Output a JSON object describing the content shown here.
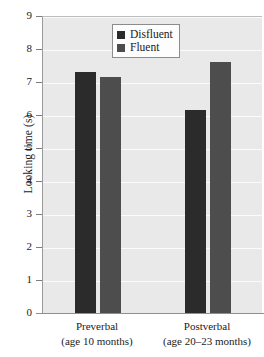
{
  "chart_data": {
    "type": "bar",
    "title": "",
    "xlabel": "",
    "ylabel": "Looking time (s)",
    "ylim": [
      0,
      9
    ],
    "yticks": [
      "0",
      "1",
      "2",
      "3",
      "4",
      "5",
      "6",
      "7",
      "8",
      "9"
    ],
    "grid": true,
    "legend_position": "top-center",
    "categories": [
      "Preverbal",
      "Postverbal"
    ],
    "category_sublabels": [
      "(age 10 months)",
      "(age 20–23 months)"
    ],
    "series": [
      {
        "name": "Disfluent",
        "color": "#2b2b2b",
        "values": [
          7.3,
          6.15
        ]
      },
      {
        "name": "Fluent",
        "color": "#4d4d4d",
        "values": [
          7.15,
          7.6
        ]
      }
    ]
  },
  "axes": {
    "y_title": "Looking time (s)",
    "y_tick_labels": [
      "9",
      "8",
      "7",
      "6",
      "5",
      "4",
      "3",
      "2",
      "1",
      "0"
    ],
    "x_categories": [
      {
        "name": "Preverbal",
        "sub": "(age 10 months)"
      },
      {
        "name": "Postverbal",
        "sub": "(age 20–23 months)"
      }
    ]
  },
  "legend": {
    "entries": [
      {
        "label": "Disfluent",
        "color": "#2b2b2b"
      },
      {
        "label": "Fluent",
        "color": "#4d4d4d"
      }
    ]
  },
  "style": {
    "plot_background": "#e9e9e9",
    "gridline_color": "#fbfbfb",
    "axis_color": "#8f8f8f",
    "text_color": "#1c1c1c",
    "page_background": "#ffffff"
  }
}
